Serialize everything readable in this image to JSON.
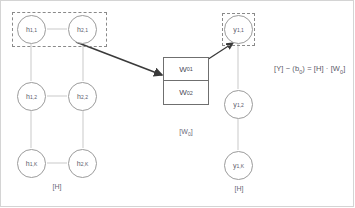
{
  "diagram": {
    "colors": {
      "node_stroke": "#9b9b9b",
      "dashed_stroke": "#8a8a8a",
      "connector": "#c9c9c9",
      "arrow": "#3a3a3a",
      "text": "#5a5a6a",
      "frame": "#d4d4d4",
      "box_stroke": "#6f6f6f"
    },
    "hidden_layer": {
      "caption": "[H]",
      "nodes": [
        {
          "id": "h-1-1",
          "base": "h",
          "sub": "1,1"
        },
        {
          "id": "h-2-1",
          "base": "h",
          "sub": "2,1"
        },
        {
          "id": "h-1-2",
          "base": "h",
          "sub": "1,2"
        },
        {
          "id": "h-2-2",
          "base": "h",
          "sub": "2,2"
        },
        {
          "id": "h-1-K",
          "base": "h",
          "sub": "1,K"
        },
        {
          "id": "h-2-K",
          "base": "h",
          "sub": "2,K"
        }
      ]
    },
    "output_layer": {
      "caption": "[H]",
      "nodes": [
        {
          "id": "y-1-1",
          "base": "y",
          "sub": "1,1"
        },
        {
          "id": "y-1-2",
          "base": "y",
          "sub": "1,2"
        },
        {
          "id": "y-1-K",
          "base": "y",
          "sub": "1,K"
        }
      ]
    },
    "weight_box": {
      "caption": "[W",
      "caption_sub": "0",
      "caption_close": "]",
      "cells": [
        {
          "base": "W",
          "sub": "01"
        },
        {
          "base": "W",
          "sub": "02"
        }
      ]
    },
    "equation": {
      "part1": "[Y] − (b",
      "sub1": "0",
      "part2": ") = [H] · [W",
      "sub2": "0",
      "part3": "]"
    }
  }
}
